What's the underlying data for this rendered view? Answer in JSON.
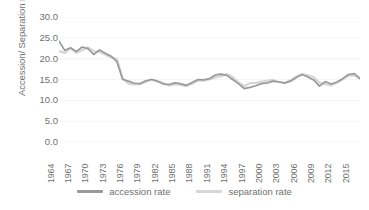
{
  "chart_data": {
    "type": "line",
    "title": "",
    "xlabel": "",
    "ylabel": "Accession/ Separation rate",
    "ylim": [
      0,
      30
    ],
    "ytick_labels": [
      "30.0",
      "25.0",
      "20.0",
      "15.0",
      "10.0",
      "5.0",
      "0.0"
    ],
    "ytick_values": [
      30,
      25,
      20,
      15,
      10,
      5,
      0
    ],
    "grid": true,
    "legend_position": "bottom",
    "xlim": [
      1964,
      2016
    ],
    "xtick_labels": [
      "1964",
      "1967",
      "1970",
      "1973",
      "1976",
      "1979",
      "1982",
      "1985",
      "1988",
      "1991",
      "1994",
      "1997",
      "2000",
      "2003",
      "2006",
      "2009",
      "2012",
      "2015"
    ],
    "x": [
      1964,
      1965,
      1966,
      1967,
      1968,
      1969,
      1970,
      1971,
      1972,
      1973,
      1974,
      1975,
      1976,
      1977,
      1978,
      1979,
      1980,
      1981,
      1982,
      1983,
      1984,
      1985,
      1986,
      1987,
      1988,
      1989,
      1990,
      1991,
      1992,
      1993,
      1994,
      1995,
      1996,
      1997,
      1998,
      1999,
      2000,
      2001,
      2002,
      2003,
      2004,
      2005,
      2006,
      2007,
      2008,
      2009,
      2010,
      2011,
      2012,
      2013,
      2014,
      2015,
      2016
    ],
    "series": [
      {
        "name": "accession rate",
        "color": "#9a9a9a",
        "values": [
          24.2,
          22.0,
          22.6,
          21.7,
          22.8,
          22.4,
          21.0,
          22.1,
          21.3,
          20.6,
          19.3,
          15.0,
          14.6,
          14.1,
          14.0,
          14.7,
          15.0,
          14.6,
          13.9,
          13.8,
          14.2,
          14.0,
          13.6,
          14.3,
          15.0,
          14.9,
          15.2,
          16.1,
          16.3,
          16.0,
          15.0,
          14.0,
          12.8,
          13.1,
          13.5,
          14.0,
          14.2,
          14.6,
          14.4,
          14.2,
          14.6,
          15.5,
          16.2,
          15.6,
          14.9,
          13.4,
          14.5,
          13.9,
          14.4,
          15.2,
          16.2,
          16.4,
          15.3
        ]
      },
      {
        "name": "separation rate",
        "color": "#d6d6d6",
        "values": [
          21.8,
          21.4,
          22.4,
          21.4,
          22.0,
          22.7,
          21.8,
          21.6,
          21.0,
          20.3,
          19.9,
          15.3,
          14.0,
          13.8,
          13.9,
          14.4,
          15.0,
          14.6,
          14.2,
          13.5,
          13.9,
          13.7,
          13.4,
          14.0,
          14.7,
          14.7,
          15.0,
          15.5,
          15.8,
          16.3,
          15.6,
          14.3,
          13.4,
          14.1,
          14.2,
          14.5,
          14.7,
          14.9,
          14.4,
          14.1,
          14.8,
          15.7,
          16.3,
          16.0,
          15.6,
          14.2,
          13.9,
          13.6,
          14.2,
          15.0,
          15.9,
          16.0,
          15.1
        ]
      }
    ]
  },
  "legend": {
    "items": [
      {
        "label": "accession rate"
      },
      {
        "label": "separation rate"
      }
    ]
  }
}
